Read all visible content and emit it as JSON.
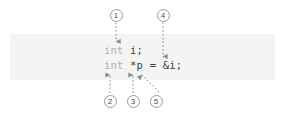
{
  "figure": {
    "band_color": "#f4f4f4",
    "keyword_color": "#b0b0b0",
    "code_color": "#3d3d3d",
    "callout_border_color": "#9a9a9a",
    "arrow_color": "#8c8c8c"
  },
  "code": {
    "lines": [
      {
        "keyword": "int",
        "rest": " i;"
      },
      {
        "keyword": "int",
        "rest": " *p = &i;"
      }
    ],
    "line1_keyword": "int",
    "line1_rest": " i;",
    "line2_keyword": "int",
    "line2_rest": " *p = &i;"
  },
  "callouts": [
    {
      "number": "1",
      "target": "int (line 1 type keyword)",
      "direction": "down"
    },
    {
      "number": "2",
      "target": "int (line 2 type keyword)",
      "direction": "up"
    },
    {
      "number": "3",
      "target": "* (pointer declarator)",
      "direction": "up"
    },
    {
      "number": "4",
      "target": "= (assignment operator)",
      "direction": "down"
    },
    {
      "number": "5",
      "target": "& (address-of operator)",
      "direction": "up-left"
    }
  ],
  "labels": {
    "c1": "1",
    "c2": "2",
    "c3": "3",
    "c4": "4",
    "c5": "5"
  }
}
